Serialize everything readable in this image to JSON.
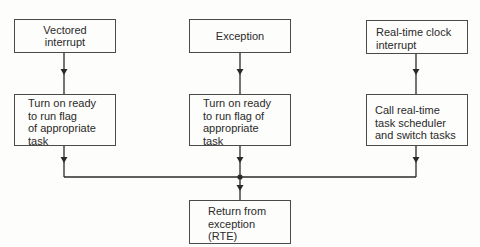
{
  "diagram": {
    "type": "flowchart",
    "colors": {
      "line": "#2a2a2a",
      "box_border": "#4a4a4a",
      "background": "#fdfdfb"
    },
    "nodes": [
      {
        "id": "vectored-interrupt",
        "label": "Vectored\ninterrupt"
      },
      {
        "id": "exception",
        "label": "Exception"
      },
      {
        "id": "rtc-interrupt",
        "label": "Real-time clock\ninterrupt"
      },
      {
        "id": "ready-flag-1",
        "label": "Turn on ready\nto run flag\nof appropriate\ntask"
      },
      {
        "id": "ready-flag-2",
        "label": "Turn on ready\nto run flag of\nappropriate\ntask"
      },
      {
        "id": "scheduler",
        "label": "Call real-time\ntask scheduler\nand switch tasks"
      },
      {
        "id": "rte",
        "label": "Return from\nexception\n(RTE)"
      }
    ],
    "edges": [
      {
        "from": "vectored-interrupt",
        "to": "ready-flag-1"
      },
      {
        "from": "exception",
        "to": "ready-flag-2"
      },
      {
        "from": "rtc-interrupt",
        "to": "scheduler"
      },
      {
        "from": "ready-flag-1",
        "to": "rte"
      },
      {
        "from": "ready-flag-2",
        "to": "rte"
      },
      {
        "from": "scheduler",
        "to": "rte"
      }
    ]
  }
}
